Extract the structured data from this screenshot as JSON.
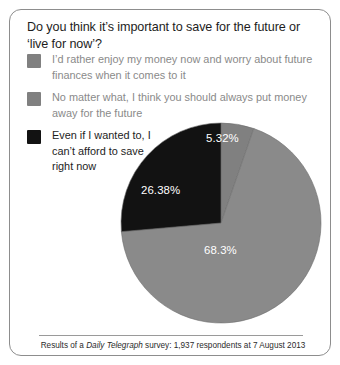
{
  "card": {
    "title": "Do you think it’s important to save for the future or ‘live for now’?",
    "footer_prefix": "Results of a ",
    "footer_publication": "Daily Telegraph",
    "footer_suffix": " survey: 1,937 respondents at 7 August 2013"
  },
  "legend": {
    "items": [
      {
        "label": "I’d rather enjoy my money now and worry about future finances when it comes to it",
        "color": "#808080",
        "swatch_name": "legend-swatch-grey-dark"
      },
      {
        "label": "No matter what, I think you should always put money away for the future",
        "color": "#808080",
        "swatch_name": "legend-swatch-grey-light"
      },
      {
        "label": "Even if I wanted to, I can’t afford to save right now",
        "color": "#121212",
        "swatch_name": "legend-swatch-black"
      }
    ]
  },
  "chart_data": {
    "type": "pie",
    "title": "Do you think it’s important to save for the future or ‘live for now’?",
    "legend_position": "top-left",
    "grid": false,
    "center": {
      "x": 211,
      "y": 213
    },
    "radius": 100,
    "start_angle_deg": 0,
    "direction": "clockwise",
    "total_respondents": 1937,
    "categories": [
      "I’d rather enjoy my money now and worry about future finances when it comes to it",
      "No matter what, I think you should always put money away for the future",
      "Even if I wanted to, I can’t afford to save right now"
    ],
    "values": [
      5.32,
      68.3,
      26.38
    ],
    "labels": [
      "5.32%",
      "68.3%",
      "26.38%"
    ],
    "colors": [
      "#808080",
      "#8a8a8a",
      "#121212"
    ],
    "label_color": "#ffffff",
    "units": "percent"
  }
}
